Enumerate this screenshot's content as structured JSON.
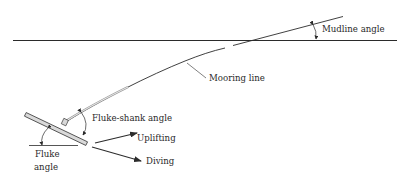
{
  "diagram": {
    "title": "",
    "labels": {
      "mudline_angle": "Mudline angle",
      "mooring_line": "Mooring line",
      "fluke_shank_angle": "Fluke-shank angle",
      "uplifting": "Uplifting",
      "diving": "Diving",
      "fluke_angle_line1": "Fluke",
      "fluke_angle_line2": "angle"
    },
    "colors": {
      "line": "#2b2b2b",
      "fluke_fill": "#d9d9d9",
      "background": "#ffffff"
    }
  }
}
